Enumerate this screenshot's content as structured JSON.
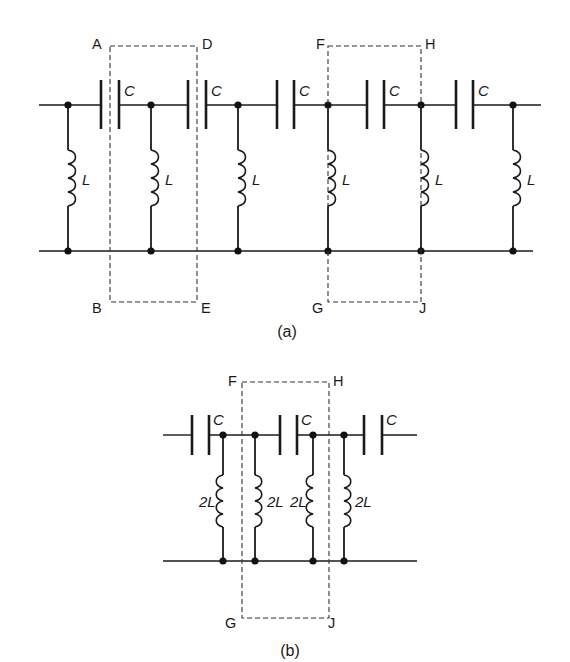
{
  "figure": {
    "colors": {
      "ink": "#1a1a1a",
      "dashed_box": "#333333",
      "background": "#ffffff"
    },
    "diagram_a": {
      "caption": "(a)",
      "top_wire": {
        "y": 105,
        "x1": 39,
        "x2": 541
      },
      "bottom_wire": {
        "y": 251,
        "x1": 39,
        "x2": 533
      },
      "nodes_x": [
        68,
        151,
        238,
        328,
        421,
        513
      ],
      "capacitors": [
        {
          "x1": 101,
          "x2": 119,
          "label": "C"
        },
        {
          "x1": 188,
          "x2": 206,
          "label": "C"
        },
        {
          "x1": 277,
          "x2": 294,
          "label": "C"
        },
        {
          "x1": 367,
          "x2": 384,
          "label": "C"
        },
        {
          "x1": 456,
          "x2": 473,
          "label": "C"
        }
      ],
      "inductors": [
        {
          "x": 68,
          "label": "L",
          "side": "right"
        },
        {
          "x": 151,
          "label": "L",
          "side": "right"
        },
        {
          "x": 238,
          "label": "L",
          "side": "right"
        },
        {
          "x": 328,
          "label": "L",
          "side": "right"
        },
        {
          "x": 421,
          "label": "L",
          "side": "right"
        },
        {
          "x": 513,
          "label": "L",
          "side": "right"
        }
      ],
      "sections": [
        {
          "corners": [
            "A",
            "D",
            "B",
            "E"
          ],
          "left": 110,
          "right": 197,
          "top": 46,
          "bottom": 302
        },
        {
          "corners": [
            "F",
            "H",
            "G",
            "J"
          ],
          "left": 328,
          "right": 421,
          "top": 46,
          "bottom": 302
        }
      ]
    },
    "diagram_b": {
      "caption": "(b)",
      "top_wire": {
        "y": 435,
        "x1": 163,
        "x2": 417
      },
      "bottom_wire": {
        "y": 561,
        "x1": 163,
        "x2": 417
      },
      "nodes_x": [
        223,
        255,
        313,
        344
      ],
      "capacitors": [
        {
          "x1": 192,
          "x2": 209,
          "label": "C"
        },
        {
          "x1": 280,
          "x2": 297,
          "label": "C"
        },
        {
          "x1": 364,
          "x2": 382,
          "label": "C"
        }
      ],
      "inductors": [
        {
          "x": 223,
          "label": "2L",
          "side": "left"
        },
        {
          "x": 255,
          "label": "2L",
          "side": "right"
        },
        {
          "x": 313,
          "label": "2L",
          "side": "left"
        },
        {
          "x": 344,
          "label": "2L",
          "side": "right"
        }
      ],
      "sections": [
        {
          "corners": [
            "F",
            "H",
            "G",
            "J"
          ],
          "left": 242,
          "right": 329,
          "top": 382,
          "bottom": 618
        }
      ]
    }
  }
}
